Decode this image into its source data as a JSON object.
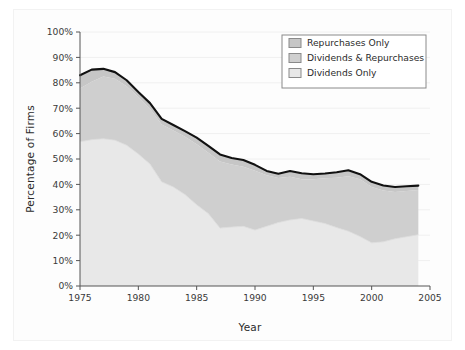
{
  "chart_data": {
    "type": "area",
    "title": "",
    "subtitle": "",
    "xlabel": "Year",
    "ylabel": "Percentage of Firms",
    "xlim": [
      1975,
      2005
    ],
    "ylim": [
      0,
      100
    ],
    "xticks": [
      1975,
      1980,
      1985,
      1990,
      1995,
      2000,
      2005
    ],
    "xtick_labels": [
      "1975",
      "1980",
      "1985",
      "1990",
      "1995",
      "2000",
      "2005"
    ],
    "yticks": [
      0,
      10,
      20,
      30,
      40,
      50,
      60,
      70,
      80,
      90,
      100
    ],
    "ytick_labels": [
      "0%",
      "10%",
      "20%",
      "30%",
      "40%",
      "50%",
      "60%",
      "70%",
      "80%",
      "90%",
      "100%"
    ],
    "grid": true,
    "grid_axis": "y",
    "stacked": true,
    "legend_position": "top-right",
    "x": [
      1975,
      1976,
      1977,
      1978,
      1979,
      1980,
      1981,
      1982,
      1983,
      1984,
      1985,
      1986,
      1987,
      1988,
      1989,
      1990,
      1991,
      1992,
      1993,
      1994,
      1995,
      1996,
      1997,
      1998,
      1999,
      2000,
      2001,
      2002,
      2003,
      2004
    ],
    "series": [
      {
        "name": "Dividends Only",
        "color": "#e8e8e8",
        "values": [
          56.8,
          57.6,
          58.0,
          57.4,
          55.4,
          52.0,
          48.0,
          41.0,
          39.0,
          36.0,
          32.0,
          28.5,
          22.8,
          23.2,
          23.5,
          22.0,
          23.5,
          25.0,
          26.0,
          26.6,
          25.6,
          24.6,
          23.0,
          21.6,
          19.5,
          17.0,
          17.4,
          18.6,
          19.4,
          20.2
        ]
      },
      {
        "name": "Dividends & Repurchases",
        "color": "#cfcfcf",
        "values": [
          21.0,
          22.8,
          24.5,
          24.2,
          23.2,
          22.4,
          21.8,
          22.6,
          22.2,
          22.8,
          23.8,
          24.0,
          26.2,
          24.6,
          23.4,
          23.4,
          20.1,
          17.5,
          17.0,
          15.4,
          16.4,
          17.8,
          19.6,
          21.6,
          22.5,
          22.0,
          20.2,
          18.4,
          18.0,
          17.6
        ]
      },
      {
        "name": "Repurchases Only",
        "color": "#c6c6c6",
        "values": [
          5.2,
          4.8,
          3.0,
          2.6,
          2.4,
          2.0,
          2.2,
          2.2,
          2.2,
          2.2,
          2.6,
          2.7,
          2.8,
          2.6,
          2.7,
          2.3,
          1.7,
          1.7,
          2.3,
          2.4,
          2.0,
          1.9,
          2.2,
          2.4,
          2.0,
          2.0,
          2.0,
          2.0,
          1.9,
          1.7
        ]
      }
    ],
    "total_outline": {
      "name": "Total payers",
      "color": "#111111",
      "values": [
        83.0,
        85.2,
        85.5,
        84.2,
        81.0,
        76.4,
        72.0,
        65.8,
        63.4,
        61.0,
        58.4,
        55.2,
        51.8,
        50.4,
        49.6,
        47.7,
        45.3,
        44.2,
        45.3,
        44.4,
        44.0,
        44.3,
        44.8,
        45.6,
        44.0,
        41.0,
        39.6,
        39.0,
        39.3,
        39.5
      ]
    }
  },
  "legend": {
    "items": [
      {
        "label": "Repurchases Only",
        "swatch": "#c6c6c6"
      },
      {
        "label": "Dividends & Repurchases",
        "swatch": "#cfcfcf"
      },
      {
        "label": "Dividends Only",
        "swatch": "#e8e8e8"
      }
    ]
  },
  "colors": {
    "plot_background": "#ffffff",
    "figure_background": "#fdfdfd",
    "axis_line": "#555555",
    "grid_line": "#f0f0f0",
    "outline": "#111111",
    "text": "#2b2b2b"
  }
}
